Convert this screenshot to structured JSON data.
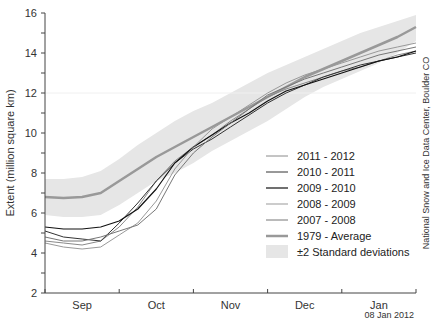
{
  "chart_data": {
    "type": "line",
    "title": "",
    "xlabel": "",
    "ylabel": "Extent (million square km)",
    "ylim": [
      2,
      16
    ],
    "yticks": [
      2,
      4,
      6,
      8,
      10,
      12,
      14,
      16
    ],
    "ytick_labels": [
      "2",
      "4",
      "6",
      "8",
      "10",
      "12",
      "14",
      "16"
    ],
    "xticks": [
      "Sep",
      "Oct",
      "Nov",
      "Dec",
      "Jan"
    ],
    "grid": "faint horizontal gridline at 12",
    "legend_position": "lower right inside plot",
    "x": [
      0,
      0.25,
      0.5,
      0.75,
      1,
      1.25,
      1.5,
      1.75,
      2,
      2.25,
      2.5,
      2.75,
      3,
      3.25,
      3.5,
      3.75,
      4,
      4.25,
      4.5,
      4.75,
      5
    ],
    "x_unit": "months since Sep 1",
    "series": [
      {
        "name": "2011 - 2012",
        "color": "#8a8a8a",
        "width": 1,
        "values": [
          4.6,
          4.5,
          4.4,
          4.6,
          5.3,
          6.3,
          7.6,
          8.6,
          9.3,
          9.9,
          10.6,
          11.2,
          11.8,
          12.2,
          12.5,
          12.8,
          13.1,
          13.3,
          13.6,
          13.9,
          14.1
        ]
      },
      {
        "name": "2010 - 2011",
        "color": "#333333",
        "width": 1,
        "values": [
          5.1,
          4.8,
          4.7,
          4.6,
          5.5,
          6.5,
          7.6,
          8.5,
          9.2,
          9.7,
          10.3,
          10.9,
          11.5,
          12.0,
          12.4,
          12.8,
          13.1,
          13.4,
          13.6,
          13.8,
          14.0
        ]
      },
      {
        "name": "2009 - 2010",
        "color": "#111111",
        "width": 1.2,
        "values": [
          5.3,
          5.2,
          5.2,
          5.3,
          5.6,
          6.2,
          7.2,
          8.5,
          9.3,
          9.9,
          10.5,
          11.0,
          11.6,
          12.1,
          12.4,
          12.7,
          13.0,
          13.3,
          13.6,
          13.8,
          14.1
        ]
      },
      {
        "name": "2008 - 2009",
        "color": "#999999",
        "width": 1,
        "values": [
          4.5,
          4.3,
          4.2,
          4.3,
          4.9,
          5.5,
          6.6,
          8.2,
          9.3,
          10.2,
          10.8,
          11.4,
          12.0,
          12.5,
          12.9,
          13.2,
          13.5,
          13.8,
          14.1,
          14.3,
          14.5
        ]
      },
      {
        "name": "2007 - 2008",
        "color": "#777777",
        "width": 1,
        "values": [
          4.8,
          4.6,
          4.6,
          4.8,
          5.1,
          5.4,
          6.2,
          7.9,
          9.0,
          9.8,
          10.5,
          11.2,
          11.9,
          12.3,
          12.7,
          13.0,
          13.3,
          13.6,
          13.9,
          14.1,
          14.3
        ]
      },
      {
        "name": "1979 - Average",
        "color": "#999999",
        "width": 2.5,
        "values": [
          6.8,
          6.75,
          6.8,
          7.0,
          7.6,
          8.2,
          8.8,
          9.3,
          9.8,
          10.3,
          10.8,
          11.3,
          11.8,
          12.3,
          12.8,
          13.2,
          13.6,
          14.0,
          14.4,
          14.8,
          15.3
        ]
      }
    ],
    "band": {
      "name": "±2 Standard deviations",
      "color": "#e6e6e6",
      "upper": [
        7.7,
        7.7,
        7.8,
        8.1,
        8.7,
        9.4,
        10.0,
        10.6,
        11.1,
        11.5,
        12.0,
        12.5,
        13.0,
        13.4,
        13.8,
        14.2,
        14.6,
        15.0,
        15.3,
        15.6,
        15.9
      ],
      "lower": [
        5.9,
        5.8,
        5.8,
        5.9,
        6.4,
        7.0,
        7.6,
        8.0,
        8.5,
        9.1,
        9.6,
        10.1,
        10.6,
        11.2,
        11.8,
        12.3,
        12.7,
        13.1,
        13.5,
        14.0,
        14.6
      ]
    }
  },
  "legend": {
    "items": [
      "2011 - 2012",
      "2010 - 2011",
      "2009 - 2010",
      "2008 - 2009",
      "2007 - 2008",
      "1979 - Average",
      "±2 Standard deviations"
    ]
  },
  "credit": "National Snow and Ice Data Center, Boulder CO",
  "date_stamp": "08 Jan 2012"
}
